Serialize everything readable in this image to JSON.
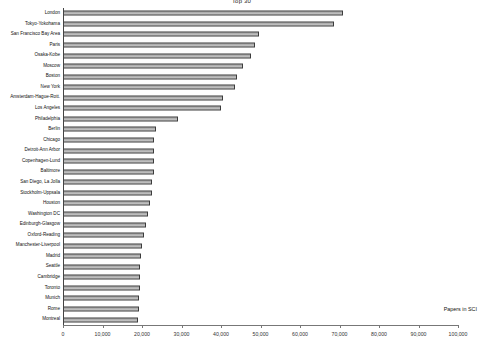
{
  "chart_data": {
    "type": "bar",
    "orientation": "horizontal",
    "title": "Top 30",
    "xlabel": "Papers in SCI",
    "ylabel": "",
    "xlim": [
      0,
      100000
    ],
    "xticks": [
      0,
      10000,
      20000,
      30000,
      40000,
      50000,
      60000,
      70000,
      80000,
      90000,
      100000
    ],
    "xticklabels": [
      "0",
      "10,000",
      "20,000",
      "30,000",
      "40,000",
      "50,000",
      "60,000",
      "70,000",
      "80,000",
      "90,000",
      "100,000"
    ],
    "grid": false,
    "legend": null,
    "categories": [
      "London",
      "Tokyo-Yokohama",
      "San Francisco Bay Area",
      "Paris",
      "Osaka-Kobe",
      "Moscow",
      "Boston",
      "New York",
      "Amsterdam-Hague-Rott.",
      "Los Angeles",
      "Philadelphia",
      "Berlin",
      "Chicago",
      "Detroit-Ann Arbor",
      "Copenhagen-Lund",
      "Baltimore",
      "San Diego, La Jolla",
      "Stockholm-Uppsala",
      "Houston",
      "Washington DC",
      "Edinburgh-Glasgow",
      "Oxford-Reading",
      "Manchester-Liverpool",
      "Madrid",
      "Seattle",
      "Cambridge",
      "Toronto",
      "Munich",
      "Rome",
      "Montreal"
    ],
    "values": [
      71000,
      68500,
      49500,
      48500,
      47500,
      45500,
      44000,
      43500,
      40500,
      40000,
      29000,
      23500,
      23000,
      23000,
      23000,
      23000,
      22500,
      22500,
      22000,
      21500,
      21000,
      20500,
      20000,
      19800,
      19600,
      19500,
      19400,
      19300,
      19200,
      19000
    ]
  }
}
